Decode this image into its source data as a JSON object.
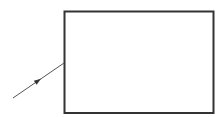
{
  "diagram": {
    "background": "#ffffff",
    "stroke_color": "#333333",
    "box": {
      "x": 64.5,
      "y": 11.5,
      "width": 149,
      "height": 101.5,
      "stroke_width": 2
    },
    "arrow": {
      "x1": 13,
      "y1": 98,
      "x2": 64,
      "y2": 63,
      "head_at": 0.5,
      "stroke_width": 1
    }
  }
}
